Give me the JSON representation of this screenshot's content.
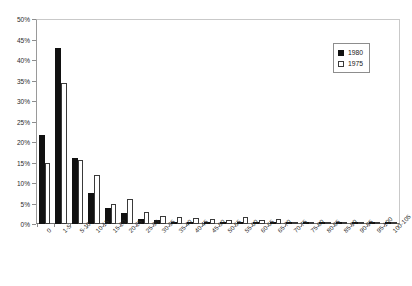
{
  "chart_data": {
    "type": "bar",
    "title": "",
    "xlabel": "",
    "ylabel": "",
    "ylim": [
      0,
      50
    ],
    "ytick_step": 5,
    "ytick_labels": [
      "0%",
      "5%",
      "10%",
      "15%",
      "20%",
      "25%",
      "30%",
      "35%",
      "40%",
      "45%",
      "50%"
    ],
    "grid": false,
    "legend_position": "top-right",
    "categories": [
      "0",
      "1-5",
      "5-10",
      "10-15",
      "15-20",
      "20-25",
      "25-30",
      "30-35",
      "35-40",
      "40-45",
      "45-50",
      "50-55",
      "55-60",
      "60-65",
      "65-70",
      "70-75",
      "75-80",
      "80-85",
      "85-90",
      "90-95",
      "95-100",
      "100-105"
    ],
    "series": [
      {
        "name": "1980",
        "color": "#111111",
        "style": "filled",
        "values": [
          21.8,
          42.9,
          16.0,
          7.5,
          3.8,
          2.7,
          1.3,
          0.9,
          0.5,
          0.4,
          0.3,
          0.3,
          0.2,
          0.2,
          0.2,
          0.1,
          0.1,
          0.1,
          0.1,
          0.1,
          0.1,
          0.1
        ]
      },
      {
        "name": "1975",
        "color": "#ffffff",
        "style": "hollow",
        "values": [
          15.0,
          34.4,
          15.5,
          12.0,
          5.0,
          6.0,
          3.0,
          2.0,
          1.6,
          1.4,
          1.2,
          1.1,
          1.6,
          0.9,
          1.3,
          0.5,
          0.4,
          0.4,
          0.3,
          0.3,
          0.3,
          0.3
        ]
      }
    ]
  },
  "legend": {
    "items": [
      {
        "label": "1980"
      },
      {
        "label": "1975"
      }
    ]
  }
}
